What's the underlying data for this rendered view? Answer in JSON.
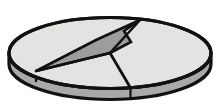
{
  "figure": {
    "description": "Shaded cylindrical pie chart viewed at an angle, divided into slices",
    "background_color": "#ffffff",
    "width": 224,
    "height": 108
  },
  "chart_data": {
    "type": "pie",
    "title": "",
    "xlabel": "",
    "ylabel": "",
    "legend_position": "none",
    "grid": false,
    "three_d": true,
    "depth_px": 11,
    "center": {
      "x": 110,
      "y": 53
    },
    "radii": {
      "rx": 101,
      "ry": 35.5
    },
    "categories": [
      "Slice A",
      "Slice B",
      "Slice C"
    ],
    "values": [
      56,
      10,
      34
    ],
    "labels": [],
    "slices": [
      {
        "name": "Slice A",
        "value": 56,
        "fill": "#e3e3e1",
        "start_angle_deg": 103,
        "end_angle_deg": 305,
        "note": "large light slice spanning right and bottom"
      },
      {
        "name": "Slice B",
        "value": 10,
        "fill": "#e3e3e1",
        "start_angle_deg": 305,
        "end_angle_deg": 326,
        "note": "thin light wedge adjacent to the dark wedge"
      },
      {
        "name": "Slice C",
        "value": 34,
        "fill": "#9d9d9b",
        "start_angle_deg": 326,
        "end_angle_deg": 103,
        "note": "dark grey exploded wedge with notched arrow profile, upper area"
      }
    ],
    "colors": {
      "top_light": "#e3e3e1",
      "top_dark": "#9d9d9b",
      "side_wall": "#a9a9a7",
      "outline": "#111111"
    },
    "ylim": [
      0,
      100
    ]
  },
  "geometry": {
    "ellipse_top": {
      "cx": 110,
      "cy": 53,
      "rx": 101,
      "ry": 35.5
    },
    "outline_width": 3.2,
    "divider_width": 2.6,
    "dark_wedge_points": "110,53 131,42 124,31 140,20 96,40 36,71",
    "divider_center_to_left_rim": {
      "x1": 110,
      "y1": 53,
      "x2": 36,
      "y2": 71
    },
    "divider_center_to_bottom_rim": {
      "x1": 110,
      "y1": 53,
      "x2": 130,
      "y2": 87
    },
    "divider_center_to_top_rim": {
      "x1": 110,
      "y1": 53,
      "x2": 140,
      "y2": 20
    }
  }
}
